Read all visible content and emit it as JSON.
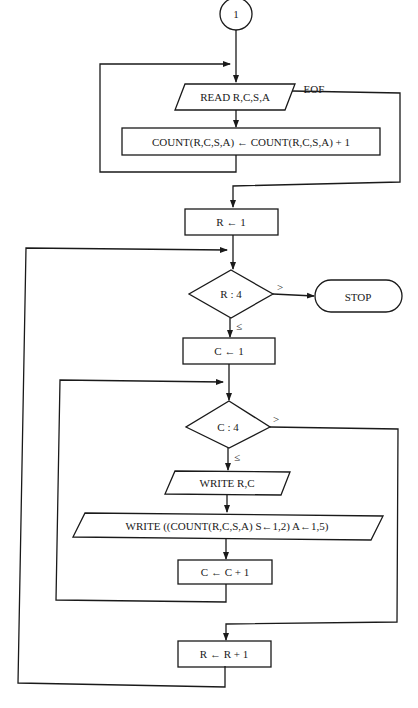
{
  "flowchart": {
    "connector": "1",
    "read": "READ R,C,S,A",
    "eof": "EOF",
    "count": "COUNT(R,C,S,A) ← COUNT(R,C,S,A) + 1",
    "r_init": "R ← 1",
    "r_test": "R : 4",
    "r_gt": ">",
    "r_le": "≤",
    "stop": "STOP",
    "c_init": "C ← 1",
    "c_test": "C : 4",
    "c_gt": ">",
    "c_le": "≤",
    "write_rc": "WRITE R,C",
    "write_count": "WRITE ((COUNT(R,C,S,A) S←1,2) A←1,5)",
    "c_inc": "C ← C + 1",
    "r_inc": "R ← R + 1"
  }
}
